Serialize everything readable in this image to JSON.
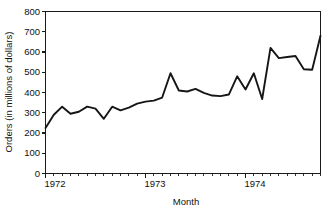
{
  "chart_data": {
    "type": "line",
    "title": "",
    "xlabel": "Month",
    "ylabel": "Orders (in millions of dollars)",
    "ylim": [
      0,
      800
    ],
    "ytick_labels": [
      "0",
      "100",
      "200",
      "300",
      "400",
      "500",
      "600",
      "700",
      "800"
    ],
    "ytick_values": [
      0,
      100,
      200,
      300,
      400,
      500,
      600,
      700,
      800
    ],
    "xtick_labels": [
      "1972",
      "1973",
      "1974"
    ],
    "xtick_values": [
      0,
      12,
      24
    ],
    "xlim": [
      0,
      33
    ],
    "grid": false,
    "legend": false,
    "series": [
      {
        "name": "Orders",
        "x": [
          0,
          1,
          2,
          3,
          4,
          5,
          6,
          7,
          8,
          9,
          10,
          11,
          12,
          13,
          14,
          15,
          16,
          17,
          18,
          19,
          20,
          21,
          22,
          23,
          24,
          25,
          26,
          27,
          28,
          29,
          30,
          31,
          32,
          33
        ],
        "values": [
          225,
          290,
          330,
          295,
          305,
          330,
          320,
          270,
          330,
          312,
          325,
          345,
          355,
          360,
          375,
          495,
          410,
          405,
          418,
          398,
          385,
          382,
          390,
          480,
          415,
          495,
          368,
          620,
          570,
          575,
          580,
          515,
          512,
          680
        ]
      }
    ]
  },
  "axes": {
    "y_axis_name": "y-axis",
    "x_axis_name": "x-axis"
  }
}
